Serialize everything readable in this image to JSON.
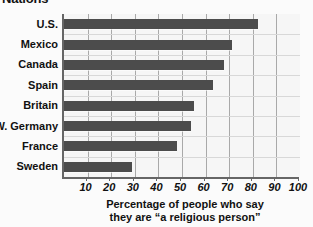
{
  "headline": "Nations",
  "chart_data": {
    "type": "bar",
    "orientation": "horizontal",
    "title": "Nations",
    "categories": [
      "U.S.",
      "Mexico",
      "Canada",
      "Spain",
      "Britain",
      "W. Germany",
      "France",
      "Sweden"
    ],
    "values": [
      82,
      71,
      68,
      63,
      55,
      54,
      48,
      29
    ],
    "xlabel": "Percentage of people who  say they are \"a religious person\"",
    "ylabel": "",
    "xlim": [
      0,
      100
    ],
    "xticks": [
      10,
      20,
      30,
      40,
      50,
      60,
      70,
      80,
      90,
      100
    ],
    "xtick_labels": [
      "10",
      "20",
      "30",
      "40",
      "50",
      "60",
      "70",
      "80",
      "90",
      "100"
    ],
    "grid": "vertical",
    "legend": "none",
    "bar_color": "#4c4c4c",
    "plot_background": "#f6f6f6",
    "gridline_color": "#a9a9a9"
  },
  "caption": {
    "line1": "Percentage of people who  say",
    "line2": "they are “a religious person”"
  }
}
